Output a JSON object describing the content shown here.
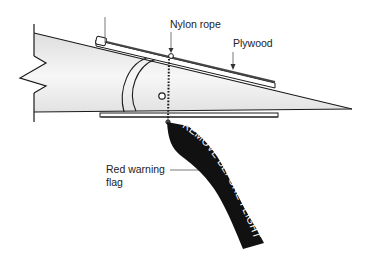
{
  "diagram": {
    "type": "control-surface-lock illustration",
    "labels": {
      "nylon_rope": "Nylon rope",
      "plywood": "Plywood",
      "red_flag_line1": "Red warning",
      "red_flag_line2": "flag"
    },
    "flag_text": "REMOVE BEFORE FLIGHT",
    "colors": {
      "outline": "#1a1a1a",
      "surface_fill": "#e9e9e9",
      "surface_highlight": "#f8f8f8",
      "plywood": "#555555",
      "flag": "#111111",
      "flag_text": "#ffffff",
      "background": "#ffffff"
    }
  }
}
